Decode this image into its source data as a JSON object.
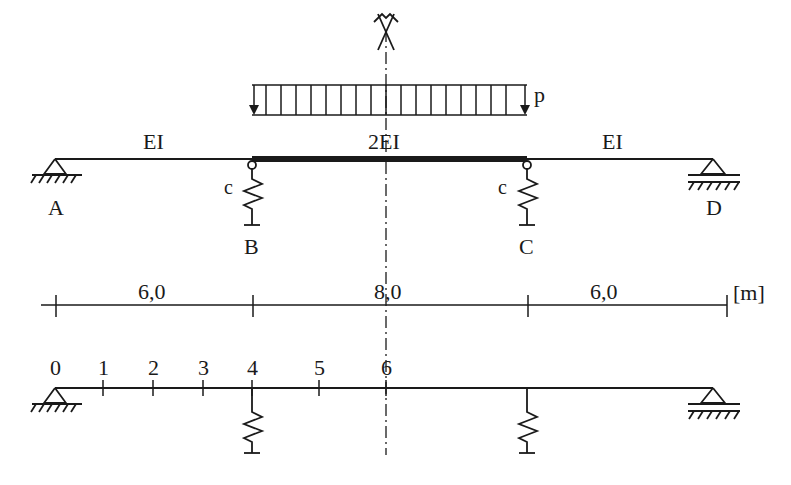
{
  "diagram": {
    "type": "continuous beam with elastic spring supports",
    "colors": {
      "ink": "#1a1a1a",
      "background": "#ffffff"
    },
    "load": {
      "label": "p",
      "type": "uniformly distributed",
      "from": "B",
      "to": "C"
    },
    "spans": [
      {
        "from": "A",
        "to": "B",
        "stiffness": "EI",
        "length": "6,0"
      },
      {
        "from": "B",
        "to": "C",
        "stiffness": "2EI",
        "length": "8,0"
      },
      {
        "from": "C",
        "to": "D",
        "stiffness": "EI",
        "length": "6,0"
      }
    ],
    "supports": [
      {
        "label": "A",
        "kind": "pinned"
      },
      {
        "label": "B",
        "kind": "spring",
        "spring_label": "c"
      },
      {
        "label": "C",
        "kind": "spring",
        "spring_label": "c"
      },
      {
        "label": "D",
        "kind": "roller"
      }
    ],
    "unit": "[m]",
    "symmetry_axis": "symmetry-axis",
    "nodes": [
      "0",
      "1",
      "2",
      "3",
      "4",
      "5",
      "6"
    ]
  }
}
